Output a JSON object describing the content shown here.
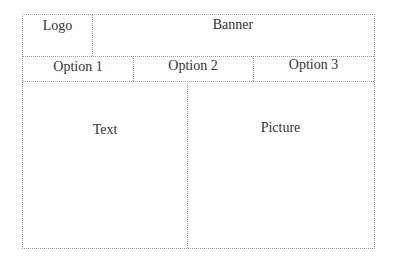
{
  "wireframe": {
    "header": {
      "logo": "Logo",
      "banner": "Banner"
    },
    "nav": {
      "options": [
        "Option 1",
        "Option 2",
        "Option 3"
      ]
    },
    "content": {
      "left": "Text",
      "right": "Picture"
    }
  }
}
